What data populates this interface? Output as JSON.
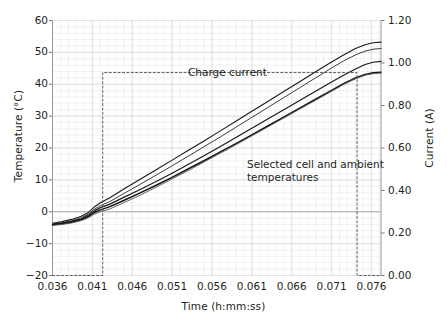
{
  "chart_data": {
    "type": "line",
    "title": "",
    "xlabel": "Time (h:mm:ss)",
    "ylabel": "Temperature (°C)",
    "y2label": "Current (A)",
    "xlim": [
      0.036,
      0.0772
    ],
    "ylim": [
      -20,
      60
    ],
    "y2lim": [
      0.0,
      1.2
    ],
    "grid": true,
    "minor_grid": true,
    "legend": "none",
    "xticks": [
      0.036,
      0.041,
      0.046,
      0.051,
      0.056,
      0.061,
      0.066,
      0.071,
      0.076
    ],
    "xticklabels": [
      "0.036",
      "0.041",
      "0.046",
      "0.051",
      "0.056",
      "0.061",
      "0.066",
      "0.071",
      "0.076"
    ],
    "yticks": [
      -20,
      -10,
      0,
      10,
      20,
      30,
      40,
      50,
      60
    ],
    "yticklabels": [
      "−20",
      "−10",
      "0",
      "10",
      "20",
      "30",
      "40",
      "50",
      "60"
    ],
    "y2ticks": [
      0.0,
      0.2,
      0.4,
      0.6,
      0.8,
      1.0,
      1.2
    ],
    "y2ticklabels": [
      "0.00",
      "0.20",
      "0.40",
      "0.60",
      "0.80",
      "1.00",
      "1.20"
    ],
    "annotations": [
      {
        "name": "charge-current",
        "text": "Charge current",
        "x": 0.0525,
        "y": 43.5
      },
      {
        "name": "selected-temps",
        "text": "Selected cell and ambient\ntemperatures",
        "x": 0.06,
        "y": 17.0
      }
    ],
    "series": [
      {
        "name": "cell-temp-1",
        "axis": "left",
        "color": "#1a1a1a",
        "width": 1.1,
        "x": [
          0.036,
          0.0372,
          0.0384,
          0.0396,
          0.0405,
          0.0412,
          0.042,
          0.0432,
          0.045,
          0.047,
          0.049,
          0.051,
          0.053,
          0.055,
          0.057,
          0.059,
          0.061,
          0.063,
          0.065,
          0.067,
          0.069,
          0.071,
          0.0725,
          0.074,
          0.0752,
          0.0762,
          0.0772
        ],
        "y": [
          -3.6,
          -3.1,
          -2.4,
          -1.4,
          -0.2,
          1.4,
          2.8,
          4.4,
          7.2,
          10.2,
          13.2,
          16.2,
          19.2,
          22.2,
          25.3,
          28.4,
          31.5,
          34.6,
          37.7,
          40.8,
          43.9,
          47.0,
          49.2,
          51.2,
          52.4,
          53.0,
          53.2
        ]
      },
      {
        "name": "cell-temp-2",
        "axis": "left",
        "color": "#3d3d3d",
        "width": 1.0,
        "x": [
          0.036,
          0.0372,
          0.0384,
          0.0396,
          0.0405,
          0.0412,
          0.042,
          0.0432,
          0.045,
          0.047,
          0.049,
          0.051,
          0.053,
          0.055,
          0.057,
          0.059,
          0.061,
          0.063,
          0.065,
          0.067,
          0.069,
          0.071,
          0.0725,
          0.074,
          0.0752,
          0.0762,
          0.0772
        ],
        "y": [
          -3.8,
          -3.4,
          -2.8,
          -1.9,
          -0.7,
          0.7,
          1.9,
          3.2,
          5.8,
          8.6,
          11.5,
          14.4,
          17.4,
          20.4,
          23.4,
          26.5,
          29.6,
          32.7,
          35.8,
          38.9,
          42.0,
          45.1,
          47.3,
          49.2,
          50.4,
          51.0,
          51.2
        ]
      },
      {
        "name": "cell-temp-3",
        "axis": "left",
        "color": "#1a1a1a",
        "width": 1.2,
        "x": [
          0.036,
          0.0372,
          0.0384,
          0.0396,
          0.0405,
          0.0412,
          0.042,
          0.0432,
          0.045,
          0.047,
          0.049,
          0.051,
          0.053,
          0.055,
          0.057,
          0.059,
          0.061,
          0.063,
          0.065,
          0.067,
          0.069,
          0.071,
          0.0725,
          0.074,
          0.0752,
          0.0762,
          0.0772
        ],
        "y": [
          -4.0,
          -3.6,
          -3.0,
          -2.2,
          -1.1,
          0.2,
          1.3,
          2.4,
          4.6,
          7.0,
          9.5,
          12.1,
          14.8,
          17.6,
          20.4,
          23.3,
          26.2,
          29.1,
          32.0,
          34.9,
          37.8,
          40.7,
          42.8,
          44.8,
          46.2,
          46.9,
          47.2
        ]
      },
      {
        "name": "ambient-temp-1",
        "axis": "left",
        "color": "#141414",
        "width": 1.5,
        "x": [
          0.036,
          0.0372,
          0.0384,
          0.0396,
          0.0405,
          0.0412,
          0.042,
          0.0432,
          0.045,
          0.047,
          0.049,
          0.051,
          0.053,
          0.055,
          0.057,
          0.059,
          0.061,
          0.063,
          0.065,
          0.067,
          0.069,
          0.071,
          0.0725,
          0.074,
          0.0752,
          0.0762,
          0.0772
        ],
        "y": [
          -4.1,
          -3.8,
          -3.3,
          -2.5,
          -1.5,
          -0.3,
          0.6,
          1.6,
          3.6,
          5.9,
          8.3,
          10.8,
          13.4,
          16.0,
          18.7,
          21.4,
          24.1,
          26.9,
          29.7,
          32.5,
          35.3,
          38.1,
          40.2,
          42.0,
          43.1,
          43.6,
          43.8
        ]
      },
      {
        "name": "ambient-temp-2",
        "axis": "left",
        "color": "#555555",
        "width": 0.9,
        "x": [
          0.036,
          0.0372,
          0.0384,
          0.0396,
          0.0405,
          0.0412,
          0.042,
          0.0432,
          0.045,
          0.047,
          0.049,
          0.051,
          0.053,
          0.055,
          0.057,
          0.059,
          0.061,
          0.063,
          0.065,
          0.067,
          0.069,
          0.071,
          0.0725,
          0.074,
          0.0752,
          0.0762,
          0.0772
        ],
        "y": [
          -4.3,
          -4.0,
          -3.5,
          -2.8,
          -1.9,
          -0.8,
          0.0,
          0.9,
          2.9,
          5.2,
          7.7,
          10.3,
          12.9,
          15.6,
          18.3,
          21.0,
          23.8,
          26.6,
          29.4,
          32.2,
          35.0,
          37.8,
          39.9,
          41.7,
          42.8,
          43.3,
          43.5
        ]
      },
      {
        "name": "charge-current",
        "axis": "right",
        "color": "#4d4d4d",
        "width": 0.9,
        "dashed": true,
        "x": [
          0.036,
          0.0423,
          0.0423,
          0.0742,
          0.0742,
          0.0772
        ],
        "y": [
          0.0,
          0.0,
          0.955,
          0.955,
          0.0,
          0.0
        ]
      }
    ]
  },
  "axes": {
    "ylabel_left": "Temperature (°C)",
    "ylabel_right": "Current (A)",
    "xlabel": "Time (h:mm:ss)"
  }
}
